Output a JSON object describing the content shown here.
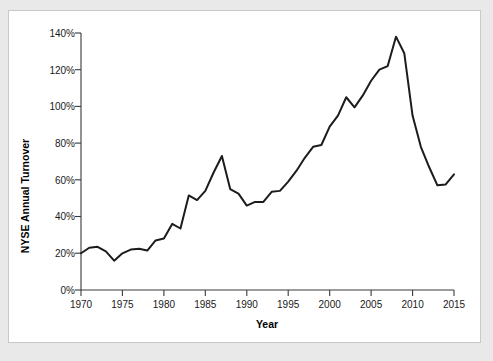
{
  "figure": {
    "background_color": "#e9e9e9",
    "panel_color": "#ffffff",
    "border_color": "#c9c9c9"
  },
  "chart_data": {
    "type": "line",
    "title": "",
    "xlabel": "Year",
    "ylabel": "NYSE Annual Turnover",
    "xlim": [
      1970,
      2015
    ],
    "ylim": [
      0,
      140
    ],
    "grid": false,
    "legend": false,
    "legend_position": "none",
    "line_color": "#1c1c1c",
    "x_tick_labels": [
      "1970",
      "1975",
      "1980",
      "1985",
      "1990",
      "1995",
      "2000",
      "2005",
      "2010",
      "2015"
    ],
    "x_ticks": [
      1970,
      1975,
      1980,
      1985,
      1990,
      1995,
      2000,
      2005,
      2010,
      2015
    ],
    "y_tick_labels": [
      "0%",
      "20%",
      "40%",
      "60%",
      "80%",
      "100%",
      "120%",
      "140%"
    ],
    "y_ticks": [
      0,
      20,
      40,
      60,
      80,
      100,
      120,
      140
    ],
    "x": [
      1970,
      1971,
      1972,
      1973,
      1974,
      1975,
      1976,
      1977,
      1978,
      1979,
      1980,
      1981,
      1982,
      1983,
      1984,
      1985,
      1986,
      1987,
      1988,
      1989,
      1990,
      1991,
      1992,
      1993,
      1994,
      1995,
      1996,
      1997,
      1998,
      1999,
      2000,
      2001,
      2002,
      2003,
      2004,
      2005,
      2006,
      2007,
      2008,
      2009,
      2010,
      2011,
      2012,
      2013,
      2014,
      2015
    ],
    "values": [
      20,
      23,
      23.5,
      21,
      16,
      20,
      22,
      22.5,
      21.5,
      27,
      28,
      36,
      33.5,
      51.5,
      49,
      54,
      64,
      73,
      55,
      52.5,
      46,
      48,
      48,
      53.5,
      54,
      59,
      65,
      72,
      78,
      79,
      89,
      95,
      105,
      99.5,
      106,
      114,
      120,
      122,
      138,
      129,
      95,
      78,
      67,
      57,
      57.5,
      63
    ],
    "series_name": "NYSE Annual Turnover"
  }
}
